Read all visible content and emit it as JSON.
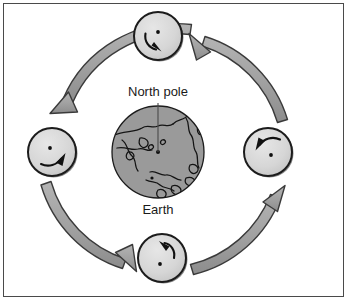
{
  "figure": {
    "title_visible": false,
    "labels": {
      "north_pole": "North pole",
      "earth": "Earth"
    },
    "colors": {
      "earth_fill": "#9a9a9a",
      "earth_outline": "#1c1c1c",
      "moon_fill": "#d8d8d8",
      "moon_outline": "#1c1c1c",
      "orbit_arrow_fill": "#a0a0a0",
      "orbit_arrow_outline": "#3a3a3a",
      "rotation_arrow": "#111111",
      "frame_border": "#4a4a4a",
      "background": "#ffffff",
      "text": "#1a1a1a",
      "leader_line": "#4a4a4a"
    },
    "earth": {
      "name": "earth-globe",
      "center_x": 158,
      "center_y": 152,
      "radius": 46,
      "view": "north-polar-projection",
      "pole_marker_visible": true
    },
    "moons": [
      {
        "name": "moon-top",
        "position": "top",
        "center_x": 158,
        "center_y": 36,
        "radius": 24,
        "rotation_arrow_direction": "counter-clockwise",
        "near_side_dot_visible": true
      },
      {
        "name": "moon-left",
        "position": "left",
        "center_x": 52,
        "center_y": 152,
        "radius": 24,
        "rotation_arrow_direction": "counter-clockwise",
        "near_side_dot_visible": true
      },
      {
        "name": "moon-bottom",
        "position": "bottom",
        "center_x": 162,
        "center_y": 258,
        "radius": 24,
        "rotation_arrow_direction": "counter-clockwise",
        "near_side_dot_visible": true
      },
      {
        "name": "moon-right",
        "position": "right",
        "center_x": 268,
        "center_y": 152,
        "radius": 24,
        "rotation_arrow_direction": "counter-clockwise",
        "near_side_dot_visible": true
      }
    ],
    "orbit_arrows": [
      {
        "name": "orbit-arrow-top-left",
        "from": "moon-top",
        "to": "moon-left",
        "direction": "counter-clockwise"
      },
      {
        "name": "orbit-arrow-bottom-left",
        "from": "moon-left",
        "to": "moon-bottom",
        "direction": "counter-clockwise"
      },
      {
        "name": "orbit-arrow-bottom-right",
        "from": "moon-bottom",
        "to": "moon-right",
        "direction": "counter-clockwise"
      },
      {
        "name": "orbit-arrow-top-right",
        "from": "moon-right",
        "to": "moon-top",
        "direction": "counter-clockwise"
      }
    ],
    "leader_line": {
      "name": "north-pole-leader-line",
      "x1": 158,
      "y1": 103,
      "x2": 158,
      "y2": 152
    }
  }
}
